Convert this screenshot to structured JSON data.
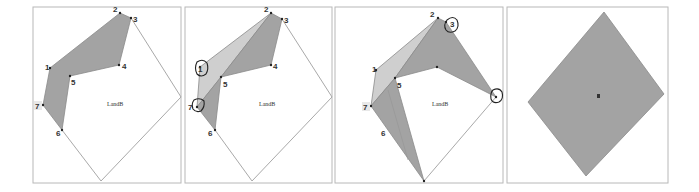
{
  "figure": {
    "panels": [
      {
        "id": "panel-1",
        "region_label": "LandB",
        "vertex_labels": [
          "1",
          "2",
          "3",
          "4",
          "5",
          "6",
          "7"
        ],
        "circled_vertices": []
      },
      {
        "id": "panel-2",
        "region_label": "LandB",
        "vertex_labels": [
          "1",
          "2",
          "3",
          "4",
          "5",
          "6",
          "7"
        ],
        "circled_vertices": [
          "1",
          "7"
        ]
      },
      {
        "id": "panel-3",
        "region_label": "LandB",
        "vertex_labels": [
          "1",
          "2",
          "3",
          "5",
          "6",
          "7"
        ],
        "circled_vertices": [
          "3",
          "right-vertex"
        ]
      },
      {
        "id": "panel-4",
        "region_label": "s",
        "vertex_labels": [],
        "circled_vertices": []
      }
    ],
    "colors": {
      "polygon_dark": "#a3a3a3",
      "polygon_light": "#cfcfcf",
      "frame": "#b8b8b8",
      "edge": "#a9a9a9"
    }
  }
}
